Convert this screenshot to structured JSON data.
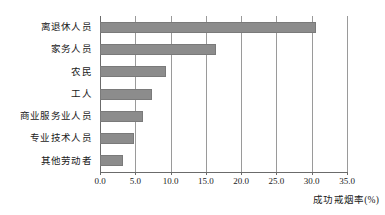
{
  "chart_data": {
    "type": "bar",
    "orientation": "horizontal",
    "title": "",
    "subtitle": "",
    "xlabel": "成功戒烟率(%)",
    "ylabel": "",
    "categories": [
      "离退休人员",
      "家务人员",
      "农民",
      "工人",
      "商业服务业人员",
      "专业技术人员",
      "其他劳动者"
    ],
    "values": [
      30.6,
      16.5,
      9.3,
      7.4,
      6.1,
      4.8,
      3.2
    ],
    "xlim": [
      0.0,
      35.0
    ],
    "xticks": [
      0.0,
      5.0,
      10.0,
      15.0,
      20.0,
      25.0,
      30.0,
      35.0
    ],
    "xtick_labels": [
      "0.0",
      "5.0",
      "10.0",
      "15.0",
      "20.0",
      "25.0",
      "30.0",
      "35.0"
    ],
    "grid": "vertical",
    "legend": "none",
    "bar_color": "#8c8c8c",
    "bar_edge_color": "#7a7a7a",
    "grid_color": "#9a9a9a",
    "axis_color": "#6b6b6b",
    "background": "#ffffff"
  }
}
